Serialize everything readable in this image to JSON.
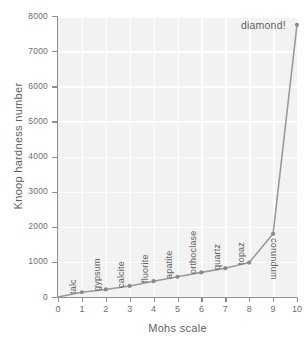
{
  "chart_data": {
    "type": "line",
    "title": "",
    "xlabel": "Mohs scale",
    "ylabel": "Knoop hardness number",
    "xlim": [
      0,
      10
    ],
    "ylim": [
      0,
      8000
    ],
    "grid": true,
    "legend": null,
    "x": [
      1,
      2,
      3,
      4,
      5,
      6,
      7,
      8,
      9,
      10
    ],
    "values": [
      135,
      215,
      315,
      450,
      575,
      700,
      820,
      980,
      1800,
      7750
    ],
    "point_labels": [
      "talc",
      "gypsum",
      "calcite",
      "fluorite",
      "apatite",
      "orthoclase",
      "quartz",
      "topaz",
      "corundum",
      "diamond!"
    ],
    "xticks": [
      "0",
      "1",
      "2",
      "3",
      "4",
      "5",
      "6",
      "7",
      "8",
      "9",
      "10"
    ],
    "yticks": [
      "0",
      "1000",
      "2000",
      "3000",
      "4000",
      "5000",
      "6000",
      "7000",
      "8000"
    ],
    "annotations": [
      {
        "text": "diamond!",
        "x": 10,
        "y": 7750
      }
    ],
    "series_color": "#9a9a9a",
    "marker_color": "#8a8a8a",
    "plot_background": "#f2f2f2",
    "grid_color": "#ffffff"
  }
}
